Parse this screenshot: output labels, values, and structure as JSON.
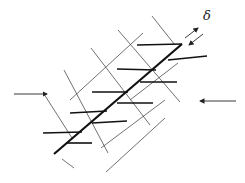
{
  "diagram": {
    "title": "",
    "labels": {
      "displacement_symbol": "δ"
    },
    "colors": {
      "ink": "#222222",
      "background": "#ffffff"
    },
    "elements": {
      "main_fault": {
        "x1": 54,
        "y1": 154,
        "x2": 182,
        "y2": 44
      },
      "compression_arrows": [
        {
          "side": "left",
          "direction": "right",
          "x1": 14,
          "y1": 94,
          "x2": 47,
          "y2": 94
        },
        {
          "side": "right",
          "direction": "left",
          "x1": 236,
          "y1": 101,
          "x2": 200,
          "y2": 101
        }
      ],
      "shear_arrows": [
        {
          "direction": "up-right",
          "x1": 185,
          "y1": 38,
          "x2": 198,
          "y2": 28
        },
        {
          "direction": "down-left",
          "x1": 203,
          "y1": 34,
          "x2": 189,
          "y2": 45
        }
      ],
      "horizontal_fractures": [
        {
          "x1": 137,
          "y1": 45,
          "x2": 182,
          "y2": 44
        },
        {
          "x1": 168,
          "y1": 60,
          "x2": 207,
          "y2": 56
        },
        {
          "x1": 117,
          "y1": 69,
          "x2": 156,
          "y2": 70
        },
        {
          "x1": 140,
          "y1": 82,
          "x2": 177,
          "y2": 82
        },
        {
          "x1": 92,
          "y1": 92,
          "x2": 128,
          "y2": 92
        },
        {
          "x1": 117,
          "y1": 103,
          "x2": 153,
          "y2": 103
        },
        {
          "x1": 70,
          "y1": 113,
          "x2": 107,
          "y2": 111
        },
        {
          "x1": 92,
          "y1": 123,
          "x2": 127,
          "y2": 121
        },
        {
          "x1": 43,
          "y1": 133,
          "x2": 82,
          "y2": 132
        },
        {
          "x1": 67,
          "y1": 143,
          "x2": 92,
          "y2": 143
        }
      ],
      "grid_lines_nw_se": [
        {
          "x1": 152,
          "y1": 16,
          "x2": 175,
          "y2": 45
        },
        {
          "x1": 118,
          "y1": 30,
          "x2": 180,
          "y2": 102
        },
        {
          "x1": 91,
          "y1": 48,
          "x2": 150,
          "y2": 125
        },
        {
          "x1": 64,
          "y1": 70,
          "x2": 108,
          "y2": 153
        },
        {
          "x1": 44,
          "y1": 94,
          "x2": 72,
          "y2": 138
        },
        {
          "x1": 62,
          "y1": 159,
          "x2": 74,
          "y2": 168
        }
      ],
      "grid_lines_ne_sw": [
        {
          "x1": 143,
          "y1": 33,
          "x2": 70,
          "y2": 100
        },
        {
          "x1": 178,
          "y1": 63,
          "x2": 130,
          "y2": 100
        },
        {
          "x1": 165,
          "y1": 100,
          "x2": 101,
          "y2": 148
        },
        {
          "x1": 165,
          "y1": 118,
          "x2": 106,
          "y2": 172
        }
      ]
    }
  }
}
